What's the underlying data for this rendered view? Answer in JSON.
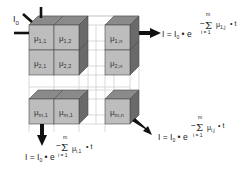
{
  "diagram": {
    "source_label": {
      "main": "I",
      "sub": "0"
    },
    "colors": {
      "front_face": "#bdbdbd",
      "top_face": "#8a8a8a",
      "side_face": "#6a6a6a",
      "grid_line": "#cfcfcf",
      "cube_edge": "#4a4a4a",
      "arrow": "#111111"
    },
    "cells": [
      {
        "row": "1",
        "col": "1",
        "label_main": "μ",
        "label_sub": "1,1"
      },
      {
        "row": "1",
        "col": "2",
        "label_main": "μ",
        "label_sub": "1,2"
      },
      {
        "row": "1",
        "col": "n",
        "label_main": "μ",
        "label_sub": "1,n"
      },
      {
        "row": "2",
        "col": "1",
        "label_main": "μ",
        "label_sub": "2,1"
      },
      {
        "row": "2",
        "col": "2",
        "label_main": "μ",
        "label_sub": "2,2"
      },
      {
        "row": "2",
        "col": "n",
        "label_main": "μ",
        "label_sub": "2,n"
      },
      {
        "row": "m",
        "col": "1",
        "label_main": "μ",
        "label_sub": "m,1"
      },
      {
        "row": "m",
        "col": "2",
        "label_main": "μ",
        "label_sub": "m,1"
      },
      {
        "row": "m",
        "col": "n",
        "label_main": "μ",
        "label_sub": "m,n"
      }
    ],
    "formulas": {
      "right": {
        "lhs": "I = I",
        "lhs_sub": "0",
        "dot_e": " • e",
        "exp_minus": "−",
        "sigma": "Σ",
        "sigma_top": "m",
        "sigma_bottom": "i = 1",
        "mu": "μ",
        "mu_sub": "1,j",
        "tail": "• t"
      },
      "diagonal": {
        "lhs": "I = I",
        "lhs_sub": "0",
        "dot_e": " • e",
        "exp_minus": "−",
        "sigma": "Σ",
        "sigma_top": "m",
        "sigma_bottom": "i = 1",
        "mu": "μ",
        "mu_sub": "i,j",
        "tail": "• t"
      },
      "bottom": {
        "lhs": "I = I",
        "lhs_sub": "0",
        "dot_e": " • e",
        "exp_minus": "−",
        "sigma": "Σ",
        "sigma_top": "m",
        "sigma_bottom": "i = 1",
        "mu": "μ",
        "mu_sub": "i,1",
        "tail": "• t"
      }
    }
  }
}
